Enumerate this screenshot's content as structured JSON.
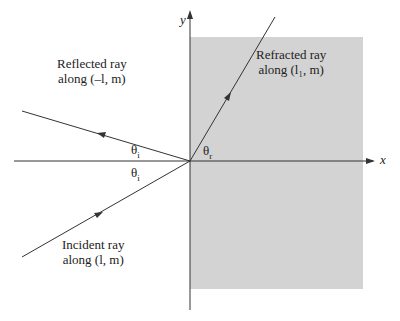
{
  "diagram": {
    "type": "ray-refraction-diagram",
    "axes": {
      "x_label": "x",
      "y_label": "y"
    },
    "medium_fill": "#d3d3d3",
    "line_color": "#333333",
    "rays": {
      "reflected": {
        "line1": "Reflected ray",
        "line2": "along (–l, m)"
      },
      "refracted": {
        "line1": "Refracted ray",
        "line2": "along (l₁, m)"
      },
      "incident": {
        "line1": "Incident ray",
        "line2": "along (l, m)"
      }
    },
    "angles": {
      "incident_upper": "θ",
      "incident_upper_sub": "i",
      "incident_lower": "θ",
      "incident_lower_sub": "i",
      "refracted": "θ",
      "refracted_sub": "r"
    }
  }
}
